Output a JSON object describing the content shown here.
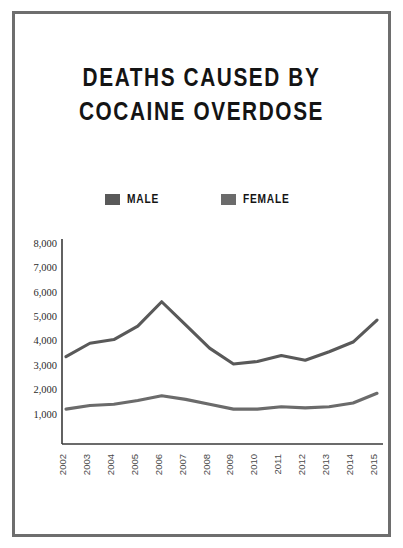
{
  "poster": {
    "title_line_1": "DEATHS CAUSED BY",
    "title_line_2": "COCAINE OVERDOSE",
    "frame_color": "#6e6e6e",
    "background_color": "#ffffff"
  },
  "legend": {
    "position": "top-center",
    "entries": [
      {
        "label": "MALE",
        "color": "#595959"
      },
      {
        "label": "FEMALE",
        "color": "#6b6b6b"
      }
    ]
  },
  "axes": {
    "y_ticks": [
      "1,000",
      "2,000",
      "3,000",
      "4,000",
      "5,000",
      "6,000",
      "7,000",
      "8,000"
    ],
    "x_ticks": [
      "2002",
      "2003",
      "2004",
      "2005",
      "2006",
      "2007",
      "2008",
      "2009",
      "2010",
      "2011",
      "2012",
      "2013",
      "2014",
      "2015"
    ],
    "y_axis_color": "#3a3a3a",
    "x_axis_color": "#3a3a3a"
  },
  "chart_data": {
    "type": "line",
    "title": "DEATHS CAUSED BY COCAINE OVERDOSE",
    "xlabel": "",
    "ylabel": "",
    "x": [
      2002,
      2003,
      2004,
      2005,
      2006,
      2007,
      2008,
      2009,
      2010,
      2011,
      2012,
      2013,
      2014,
      2015
    ],
    "categories": [
      "2002",
      "2003",
      "2004",
      "2005",
      "2006",
      "2007",
      "2008",
      "2009",
      "2010",
      "2011",
      "2012",
      "2013",
      "2014",
      "2015"
    ],
    "series": [
      {
        "name": "MALE",
        "color": "#595959",
        "values": [
          3350,
          3900,
          4050,
          4600,
          5600,
          4650,
          3700,
          3050,
          3150,
          3400,
          3200,
          3550,
          3950,
          4850
        ]
      },
      {
        "name": "FEMALE",
        "color": "#6b6b6b",
        "values": [
          1200,
          1350,
          1400,
          1550,
          1750,
          1600,
          1400,
          1200,
          1200,
          1300,
          1250,
          1300,
          1450,
          1850
        ]
      }
    ],
    "ylim": [
      0,
      8000
    ],
    "ytick_values": [
      1000,
      2000,
      3000,
      4000,
      5000,
      6000,
      7000,
      8000
    ],
    "grid": false,
    "legend_position": "top-center",
    "xtick_rotation": -90
  }
}
